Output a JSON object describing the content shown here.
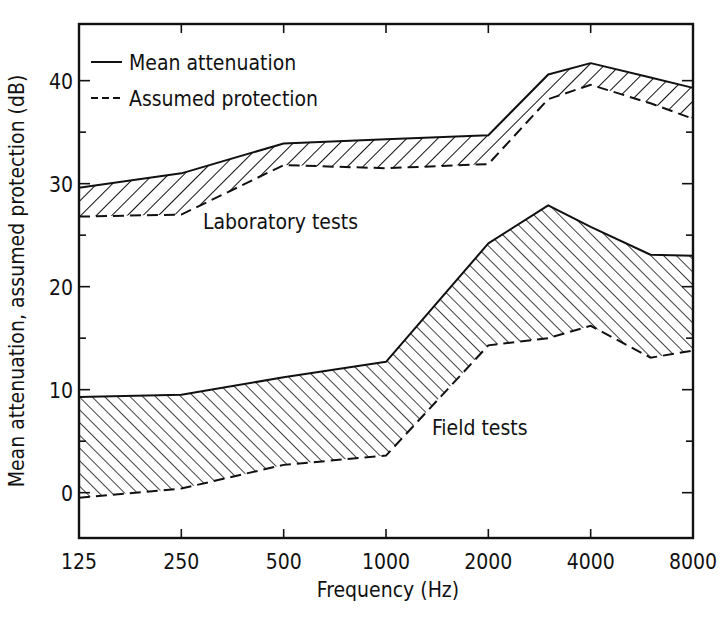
{
  "chart_data": {
    "type": "area",
    "title": "",
    "xlabel": "Frequency (Hz)",
    "ylabel": "Mean attenuation, assumed protection (dB)",
    "x_scale": "log2",
    "x_ticks": [
      125,
      250,
      500,
      1000,
      2000,
      4000,
      8000
    ],
    "x_tick_labels": [
      "125",
      "250",
      "500",
      "1000",
      "2000",
      "4000",
      "8000"
    ],
    "y_ticks_major": [
      0,
      10,
      20,
      30,
      40
    ],
    "y_tick_labels": [
      "0",
      "10",
      "20",
      "30",
      "40"
    ],
    "y_ticks_minor": [
      5,
      15,
      25,
      35
    ],
    "xlim": [
      125,
      8000
    ],
    "ylim": [
      -4.4,
      45.5
    ],
    "grid": false,
    "legend": {
      "position": "upper-left",
      "entries": [
        {
          "label": "Mean attenuation",
          "style": "solid"
        },
        {
          "label": "Assumed protection",
          "style": "dashed"
        }
      ]
    },
    "annotations": [
      {
        "text": "Laboratory tests",
        "x": 700,
        "y": 26
      },
      {
        "text": "Field tests",
        "x": 2800,
        "y": 6
      }
    ],
    "bands": [
      {
        "name": "Laboratory tests",
        "hatch": "forward",
        "mean_attenuation": {
          "x": [
            125,
            250,
            500,
            1000,
            2000,
            3000,
            4000,
            6000,
            8000
          ],
          "y": [
            29.6,
            31.0,
            33.9,
            34.3,
            34.7,
            40.6,
            41.7,
            40.3,
            39.3
          ]
        },
        "assumed_protection": {
          "x": [
            125,
            250,
            500,
            1000,
            2000,
            3000,
            4000,
            6000,
            8000
          ],
          "y": [
            26.8,
            27.0,
            31.8,
            31.5,
            31.9,
            38.2,
            39.6,
            37.8,
            36.3
          ]
        }
      },
      {
        "name": "Field tests",
        "hatch": "backward",
        "mean_attenuation": {
          "x": [
            125,
            250,
            500,
            1000,
            2000,
            3000,
            4000,
            6000,
            8000
          ],
          "y": [
            9.3,
            9.5,
            11.2,
            12.7,
            24.2,
            27.9,
            25.8,
            23.1,
            23.0
          ]
        },
        "assumed_protection": {
          "x": [
            125,
            250,
            500,
            1000,
            2000,
            3000,
            4000,
            6000,
            8000
          ],
          "y": [
            -0.5,
            0.4,
            2.7,
            3.6,
            14.3,
            15.0,
            16.2,
            13.1,
            13.8
          ]
        }
      }
    ]
  }
}
